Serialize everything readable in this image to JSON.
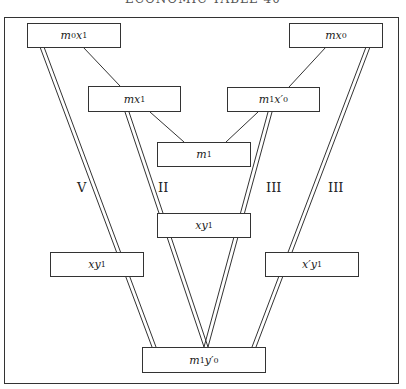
{
  "title": "ECONOMIC TABLE 40",
  "boxes": {
    "m0x1": {
      "base": "m",
      "sub1": "0",
      "base2": "x",
      "sub2": "1"
    },
    "mx0": {
      "base": "mx",
      "sub1": "0"
    },
    "mx1": {
      "base": "mx",
      "sub1": "1"
    },
    "m1xp0": {
      "base": "m",
      "sub1": "1",
      "base2": "x′",
      "sub2": "0"
    },
    "m1": {
      "base": "m",
      "sub1": "1"
    },
    "xy1_center": {
      "base": "xy",
      "sub1": "1"
    },
    "xy1_left": {
      "base": "xy",
      "sub1": "1"
    },
    "xpy1": {
      "base": "x′y",
      "sub1": "1"
    },
    "m1yp0": {
      "base": "m",
      "sub1": "1",
      "base2": "y′",
      "sub2": "0"
    }
  },
  "labels": {
    "V": "V",
    "II": "II",
    "III_inner": "III",
    "III_outer": "III"
  }
}
